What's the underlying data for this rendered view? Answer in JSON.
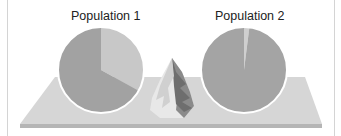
{
  "figure": {
    "populations": [
      {
        "label": "Population 1",
        "slices": [
          {
            "name": "light",
            "fraction": 0.33,
            "color": "#c8c8c8"
          },
          {
            "name": "dark",
            "fraction": 0.67,
            "color": "#a2a2a2"
          }
        ]
      },
      {
        "label": "Population 2",
        "slices": [
          {
            "name": "light",
            "fraction": 0.02,
            "color": "#cfcfcf"
          },
          {
            "name": "dark",
            "fraction": 0.98,
            "color": "#a4a4a4"
          }
        ]
      }
    ],
    "platform_color": "#d6d6d6",
    "platform_edge_color": "#b5b5b5",
    "pie_border_color": "#ffffff",
    "center_object": "mountain-landscape"
  }
}
